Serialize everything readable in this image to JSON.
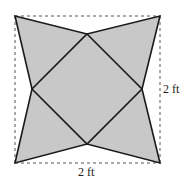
{
  "diagram": {
    "shape": "four-pointed star inscribed in a square",
    "colors": {
      "fill": "#c8c8c8",
      "stroke": "#1a1a1a",
      "dashed": "#555555",
      "background": "#ffffff"
    },
    "outer_square": {
      "corners": [
        [
          15,
          16
        ],
        [
          160,
          16
        ],
        [
          160,
          163
        ],
        [
          15,
          163
        ]
      ],
      "style": "dashed"
    },
    "inner_vertices": {
      "top": [
        87,
        34
      ],
      "right": [
        142,
        89
      ],
      "bottom": [
        87,
        144
      ],
      "left": [
        32,
        89
      ]
    },
    "labels": {
      "right_dimension": "2 ft",
      "bottom_dimension": "2 ft"
    }
  }
}
